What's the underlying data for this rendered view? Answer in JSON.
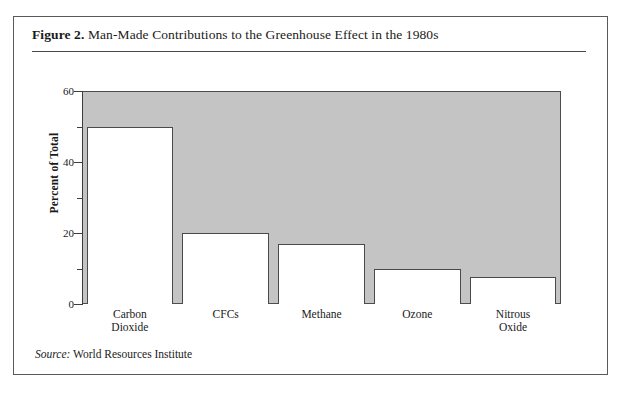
{
  "figure": {
    "label": "Figure 2.",
    "title": " Man-Made Contributions to the Greenhouse Effect in the 1980s",
    "source_word": "Source:",
    "source_text": " World Resources Institute"
  },
  "chart_data": {
    "type": "bar",
    "title": "Man-Made Contributions to the Greenhouse Effect in the 1980s",
    "xlabel": "",
    "ylabel": "Percent of Total",
    "ylim": [
      0,
      60
    ],
    "yticks": [
      0,
      10,
      20,
      30,
      40,
      50,
      60
    ],
    "ytick_labels": [
      "0",
      "20",
      "40",
      "60"
    ],
    "ytick_labels_major": [
      0,
      20,
      40,
      60
    ],
    "grid": false,
    "legend": null,
    "categories": [
      "Carbon Dioxide",
      "CFCs",
      "Methane",
      "Ozone",
      "Nitrous Oxide"
    ],
    "category_lines": [
      [
        "Carbon",
        "Dioxide"
      ],
      [
        "CFCs"
      ],
      [
        "Methane"
      ],
      [
        "Ozone"
      ],
      [
        "Nitrous",
        "Oxide"
      ]
    ],
    "values": [
      50,
      20,
      17,
      10,
      7.5
    ],
    "bar_fill_color": "#ffffff",
    "bar_edge_color": "#4a4a4a",
    "plot_background_color": "#c4c4c4",
    "source": "World Resources Institute"
  }
}
